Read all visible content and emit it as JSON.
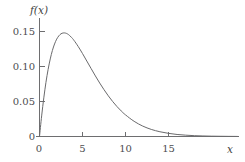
{
  "chart_data": {
    "type": "line",
    "title": "",
    "subtitle": "",
    "xlabel": "x",
    "ylabel": "f(x)",
    "xlim": [
      -1,
      23
    ],
    "ylim": [
      0,
      0.168
    ],
    "grid": false,
    "legend": null,
    "x_ticks": [
      {
        "value": 0,
        "label": "0"
      },
      {
        "value": 5,
        "label": "5"
      },
      {
        "value": 10,
        "label": "10"
      },
      {
        "value": 15,
        "label": "15"
      }
    ],
    "y_ticks": [
      {
        "value": 0,
        "label": "0"
      },
      {
        "value": 0.05,
        "label": "0.05"
      },
      {
        "value": 0.1,
        "label": "0.10"
      },
      {
        "value": 0.15,
        "label": "0.15"
      }
    ],
    "series": [
      {
        "name": "f(x)",
        "color": "#6a6a6c",
        "x": [
          0,
          0.25,
          0.5,
          0.75,
          1,
          1.25,
          1.5,
          1.75,
          2,
          2.25,
          2.5,
          2.75,
          3,
          3.25,
          3.5,
          3.75,
          4,
          4.5,
          5,
          5.5,
          6,
          6.5,
          7,
          7.5,
          8,
          8.5,
          9,
          9.5,
          10,
          11,
          12,
          13,
          14,
          15,
          16,
          17,
          18,
          19,
          20,
          21,
          22,
          23
        ],
        "values": [
          0,
          0.0294,
          0.0552,
          0.0773,
          0.0957,
          0.1108,
          0.1229,
          0.1322,
          0.1391,
          0.1438,
          0.1467,
          0.1479,
          0.1478,
          0.1466,
          0.1443,
          0.1412,
          0.1375,
          0.1286,
          0.1185,
          0.1078,
          0.0971,
          0.0865,
          0.0764,
          0.0669,
          0.0581,
          0.0501,
          0.0429,
          0.0365,
          0.0309,
          0.0217,
          0.0149,
          0.0101,
          0.0068,
          0.0045,
          0.0029,
          0.0019,
          0.0012,
          0.00077,
          0.00049,
          0.00031,
          0.00019,
          0.00012
        ]
      }
    ],
    "peak": {
      "x": 2.8,
      "y": 0.1479
    }
  },
  "axis": {
    "y_title": "f(x)",
    "x_title": "x",
    "origin_label": "0"
  },
  "colors": {
    "axis": "#6e6e70",
    "curve": "#6a6a6c",
    "text": "#4d4d4f",
    "background": "#ffffff"
  }
}
